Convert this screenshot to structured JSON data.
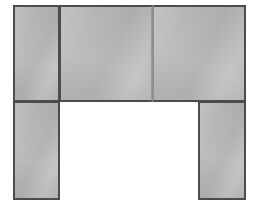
{
  "figure": {
    "background_color": "#ffffff",
    "canvas": {
      "width": 256,
      "height": 223
    },
    "style": {
      "fill_color": "#b6b6b6",
      "stroke_color": "#4c4c4c",
      "stroke_width_px": 2
    },
    "shapes": [
      {
        "id": "top-left-rect",
        "label": "top-left rectangle",
        "row": "top",
        "x": 13,
        "y": 5,
        "width": 47,
        "height": 97
      },
      {
        "id": "top-center-rect",
        "label": "top-center rectangle",
        "row": "top",
        "x": 59,
        "y": 5,
        "width": 94,
        "height": 97
      },
      {
        "id": "top-right-rect",
        "label": "top-right rectangle",
        "row": "top",
        "x": 152,
        "y": 5,
        "width": 94,
        "height": 97
      },
      {
        "id": "bottom-left-rect",
        "label": "bottom-left leg rectangle",
        "row": "bottom",
        "x": 13,
        "y": 101,
        "width": 47,
        "height": 99
      },
      {
        "id": "bottom-right-rect",
        "label": "bottom-right leg rectangle",
        "row": "bottom",
        "x": 198,
        "y": 101,
        "width": 48,
        "height": 99
      }
    ],
    "opening": {
      "label": "central opening",
      "x": 60,
      "y": 101,
      "width": 138,
      "height": 99,
      "color": "#ffffff"
    }
  }
}
